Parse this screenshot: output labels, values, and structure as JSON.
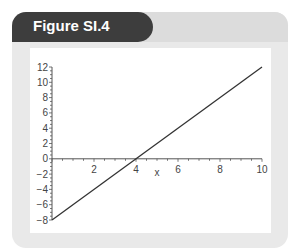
{
  "figure": {
    "title": "Figure SI.4"
  },
  "chart_data": {
    "type": "line",
    "title": "Figure SI.4",
    "xlabel": "x",
    "ylabel": "",
    "xlim": [
      0,
      10
    ],
    "ylim": [
      -8,
      12
    ],
    "x_ticks": [
      "2",
      "4",
      "6",
      "8",
      "10"
    ],
    "y_ticks": [
      "12",
      "10",
      "8",
      "6",
      "4",
      "2",
      "0",
      "-2",
      "-4",
      "-6",
      "-8"
    ],
    "series": [
      {
        "name": "y = 2x - 8",
        "x": [
          0,
          10
        ],
        "y": [
          -8,
          12
        ]
      }
    ],
    "grid": false,
    "legend": "none",
    "line_color": "#333333"
  },
  "colors": {
    "tab_dark": "#3d3d3d",
    "panel": "#e9e9e9",
    "plot_bg": "#ffffff"
  }
}
